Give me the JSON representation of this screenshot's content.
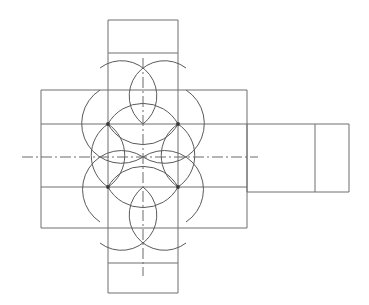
{
  "drawing": {
    "title": "Orthographic construction drawing of cruciform part",
    "type": "engineering-line-drawing",
    "canvas": {
      "width": 369,
      "height": 305,
      "background": "#ffffff"
    },
    "colors": {
      "outline_stroke": "#6e6e6e",
      "arc_stroke": "#5a5a5a",
      "centerline_stroke": "#6a6a6a",
      "node_fill": "#3a3a3a"
    },
    "geometry": {
      "horizontal_band": {
        "name": "horizontal-arm-rectangle",
        "x1": 41,
        "y1": 90,
        "x2": 247,
        "y2": 228,
        "internal_horizontal_lines": [
          124,
          187
        ]
      },
      "vertical_band": {
        "name": "vertical-arm-rectangle",
        "x1": 108,
        "y1": 20,
        "x2": 178,
        "y2": 293,
        "internal_horizontal_lines": [
          53,
          263
        ]
      },
      "right_extension": {
        "name": "right-side-view-band",
        "x1": 247,
        "y1": 124,
        "x2": 349,
        "y2": 192,
        "internal_vertical_lines": [
          315
        ]
      },
      "nodes": [
        {
          "name": "node-top-left",
          "x": 108,
          "y": 124
        },
        {
          "name": "node-top-right",
          "x": 178,
          "y": 124
        },
        {
          "name": "node-bottom-left",
          "x": 108,
          "y": 187
        },
        {
          "name": "node-bottom-right",
          "x": 178,
          "y": 187
        }
      ],
      "arc_radius": 35,
      "arcs": [
        {
          "name": "arc-centered-top-left",
          "cx": 108,
          "cy": 124,
          "r": 35
        },
        {
          "name": "arc-centered-top-right",
          "cx": 178,
          "cy": 124,
          "r": 35
        },
        {
          "name": "arc-centered-bottom-left",
          "cx": 108,
          "cy": 187,
          "r": 35
        },
        {
          "name": "arc-centered-bottom-right",
          "cx": 178,
          "cy": 187,
          "r": 35
        }
      ],
      "centerlines": {
        "horizontal": {
          "name": "horizontal-centerline",
          "y": 157,
          "x_start": 22,
          "x_end": 258
        },
        "vertical": {
          "name": "vertical-centerline",
          "x": 143,
          "y_start": 58,
          "y_end": 276
        }
      }
    }
  }
}
